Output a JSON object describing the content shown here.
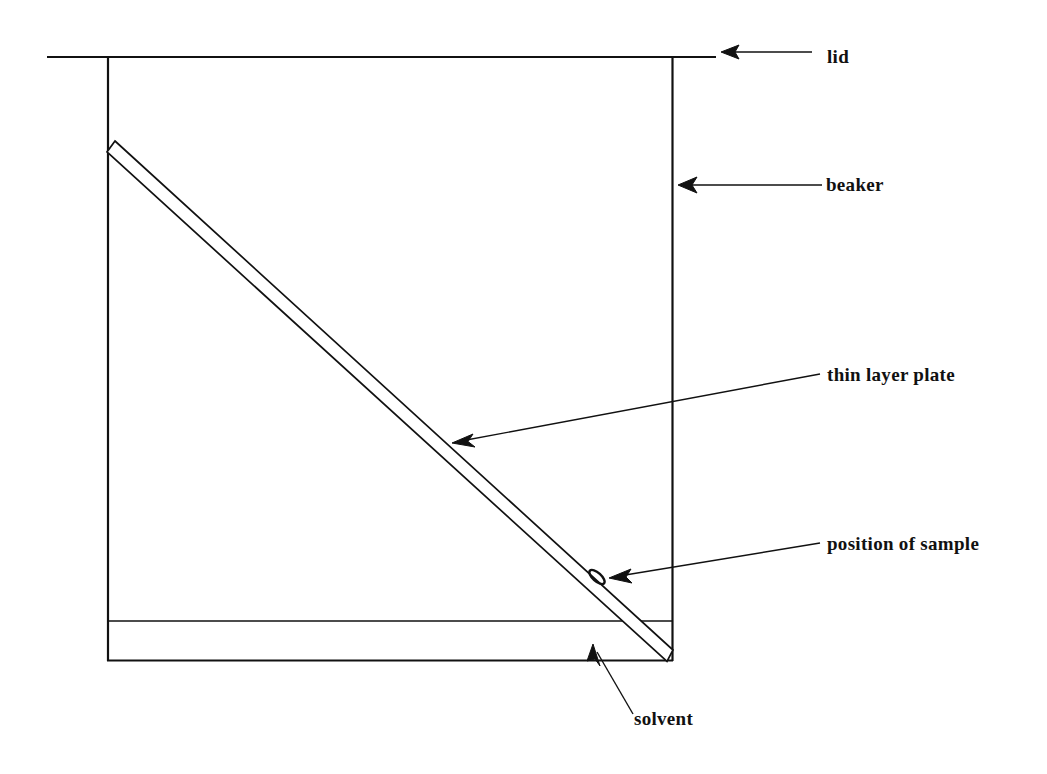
{
  "figure": {
    "kind": "technical-line-diagram",
    "background_color": "#ffffff",
    "ink_color": "#111111"
  },
  "labels": {
    "lid": "lid",
    "beaker": "beaker",
    "thin_layer_plate": "thin layer plate",
    "position_of_sample": "position of sample",
    "solvent": "solvent"
  },
  "label_positions": {
    "lid": {
      "x": 827,
      "y": 47
    },
    "beaker": {
      "x": 826,
      "y": 175
    },
    "thin_layer_plate": {
      "x": 827,
      "y": 365
    },
    "position_of_sample": {
      "x": 827,
      "y": 534
    },
    "solvent": {
      "x": 634,
      "y": 709
    }
  },
  "geometry": {
    "lid_line": {
      "x1": 47,
      "y1": 57,
      "x2": 716,
      "y2": 57
    },
    "beaker_left_wall": {
      "x1": 107,
      "y1": 57,
      "x2": 107,
      "y2": 661
    },
    "beaker_right_wall": {
      "x1": 673,
      "y1": 57,
      "x2": 673,
      "y2": 661
    },
    "beaker_bottom": {
      "x1": 107,
      "y1": 661,
      "x2": 673,
      "y2": 661
    },
    "solvent_level_line": {
      "x1": 107,
      "y1": 621,
      "x2": 673,
      "y2": 621
    },
    "plate_polygon": [
      {
        "x": 115,
        "y": 141
      },
      {
        "x": 673,
        "y": 650
      },
      {
        "x": 667,
        "y": 661
      },
      {
        "x": 107,
        "y": 152
      }
    ],
    "sample_spot": {
      "cx": 597,
      "cy": 577,
      "rx": 9,
      "ry": 4,
      "rotation_deg": 42
    }
  },
  "arrows": {
    "lid": {
      "tail_x": 812,
      "tail_y": 52,
      "head_x": 722,
      "head_y": 52
    },
    "beaker": {
      "tail_x": 822,
      "tail_y": 185,
      "head_x": 678,
      "head_y": 185
    },
    "thin_layer_plate": {
      "tail_x": 820,
      "tail_y": 374,
      "head_x": 452,
      "head_y": 443
    },
    "position_of_sample": {
      "tail_x": 820,
      "tail_y": 543,
      "head_x": 610,
      "head_y": 578
    },
    "solvent": {
      "tail_x": 633,
      "tail_y": 714,
      "head_x": 593,
      "head_y": 645
    }
  }
}
